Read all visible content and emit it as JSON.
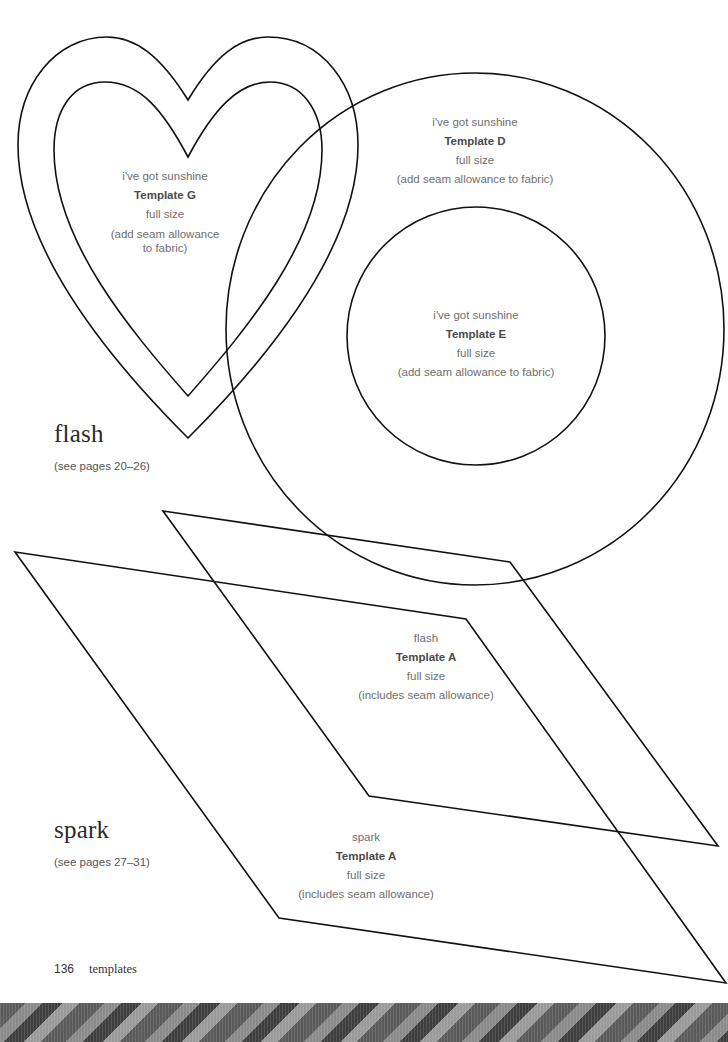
{
  "templates": {
    "heart_g": {
      "project": "i've got sunshine",
      "name": "Template G",
      "size": "full size",
      "note": "(add seam allowance to fabric)"
    },
    "circle_d": {
      "project": "i've got sunshine",
      "name": "Template D",
      "size": "full size",
      "note": "(add seam allowance to fabric)"
    },
    "circle_e": {
      "project": "i've got sunshine",
      "name": "Template E",
      "size": "full size",
      "note": "(add seam allowance to fabric)"
    },
    "flash_a": {
      "project": "flash",
      "name": "Template A",
      "size": "full size",
      "note": "(includes seam allowance)"
    },
    "spark_a": {
      "project": "spark",
      "name": "Template A",
      "size": "full size",
      "note": "(includes seam allowance)"
    }
  },
  "sections": {
    "flash": {
      "title": "flash",
      "pages": "(see pages 20–26)"
    },
    "spark": {
      "title": "spark",
      "pages": "(see pages 27–31)"
    }
  },
  "footer": {
    "page_number": "136",
    "chapter": "templates"
  },
  "colors": {
    "line": "#111111",
    "text": "#6e6e6e",
    "text_bold": "#4a4a4a"
  }
}
